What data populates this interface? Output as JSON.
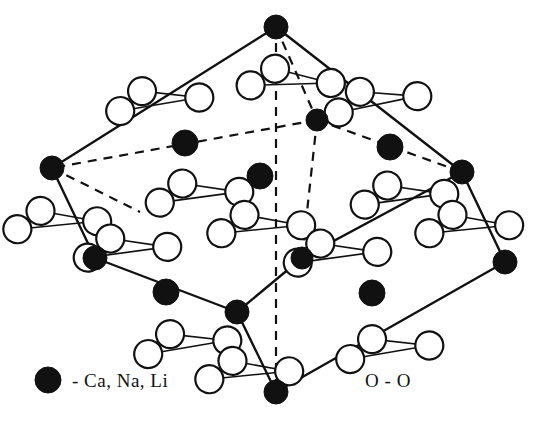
{
  "figure": {
    "colors": {
      "atom_fill": "#111111",
      "atom_open_fill": "#ffffff",
      "stroke": "#111111",
      "background": "#ffffff"
    }
  },
  "legend": {
    "cation_symbol": "filled-circle",
    "cation_label": "- Ca, Na, Li",
    "oxygen_label": "O - O",
    "oxygen_symbol": "open-circle"
  },
  "structure": {
    "cell_vertices": [
      {
        "id": "top",
        "x": 276,
        "y": 27,
        "r": 12,
        "type": "cation"
      },
      {
        "id": "left",
        "x": 52,
        "y": 168,
        "r": 12,
        "type": "cation"
      },
      {
        "id": "right",
        "x": 462,
        "y": 172,
        "r": 12,
        "type": "cation"
      },
      {
        "id": "back",
        "x": 317,
        "y": 120,
        "r": 11,
        "type": "cation"
      },
      {
        "id": "lower-left",
        "x": 95,
        "y": 258,
        "r": 12,
        "type": "cation"
      },
      {
        "id": "lower-right",
        "x": 505,
        "y": 262,
        "r": 12,
        "type": "cation"
      },
      {
        "id": "front-mid",
        "x": 237,
        "y": 312,
        "r": 12,
        "type": "cation"
      },
      {
        "id": "bottom",
        "x": 276,
        "y": 392,
        "r": 12,
        "type": "cation"
      },
      {
        "id": "inner-right",
        "x": 302,
        "y": 258,
        "r": 11,
        "type": "cation"
      }
    ],
    "interior_cations": [
      {
        "id": "int-1",
        "x": 185,
        "y": 143,
        "r": 13
      },
      {
        "id": "int-2",
        "x": 260,
        "y": 176,
        "r": 13
      },
      {
        "id": "int-3",
        "x": 390,
        "y": 147,
        "r": 13
      },
      {
        "id": "int-4",
        "x": 166,
        "y": 292,
        "r": 13
      },
      {
        "id": "int-5",
        "x": 372,
        "y": 293,
        "r": 13
      }
    ],
    "solid_edges": [
      {
        "from": "top",
        "to": "left"
      },
      {
        "from": "top",
        "to": "right"
      },
      {
        "from": "left",
        "to": "lower-left"
      },
      {
        "from": "right",
        "to": "lower-right"
      },
      {
        "from": "lower-left",
        "to": "front-mid"
      },
      {
        "from": "front-mid",
        "to": "bottom"
      },
      {
        "from": "bottom",
        "to": "lower-right"
      },
      {
        "from": "front-mid",
        "to": "inner-right"
      },
      {
        "from": "inner-right",
        "to": "right"
      }
    ],
    "dashed_edges": [
      {
        "from": "top",
        "to": "back"
      },
      {
        "from": "back",
        "to": "left"
      },
      {
        "from": "back",
        "to": "right"
      },
      {
        "from": "top",
        "to": "bottom",
        "note": "vertical axis"
      },
      {
        "from": "back",
        "to": "inner-right"
      },
      {
        "from": "left",
        "to": "inner-left-hidden"
      }
    ],
    "oxygen_clusters": [
      {
        "id": "ox-top-left",
        "cx": 160,
        "cy": 97,
        "angle": -14
      },
      {
        "id": "ox-top-inner",
        "cx": 292,
        "cy": 77,
        "angle": -6
      },
      {
        "id": "ox-top-right",
        "cx": 378,
        "cy": 97,
        "angle": -16
      },
      {
        "id": "ox-left-edge",
        "cx": 58,
        "cy": 218,
        "angle": -10
      },
      {
        "id": "ox-left-low",
        "cx": 128,
        "cy": 245,
        "angle": -12
      },
      {
        "id": "ox-mid-left",
        "cx": 200,
        "cy": 190,
        "angle": -12
      },
      {
        "id": "ox-center",
        "cx": 262,
        "cy": 222,
        "angle": -10
      },
      {
        "id": "ox-mid-right",
        "cx": 405,
        "cy": 192,
        "angle": -12
      },
      {
        "id": "ox-right-edge",
        "cx": 470,
        "cy": 222,
        "angle": -10
      },
      {
        "id": "ox-inner-low",
        "cx": 338,
        "cy": 250,
        "angle": -12
      },
      {
        "id": "ox-bot-left",
        "cx": 188,
        "cy": 340,
        "angle": -14
      },
      {
        "id": "ox-bot-mid",
        "cx": 250,
        "cy": 368,
        "angle": -10
      },
      {
        "id": "ox-bot-right",
        "cx": 390,
        "cy": 345,
        "angle": -14
      }
    ],
    "oxygen_radius": 14,
    "cluster_offsets": {
      "left_a": {
        "dx": -42,
        "dy": 4
      },
      "left_b": {
        "dx": -16,
        "dy": -10
      },
      "right": {
        "dx": 38,
        "dy": 10
      }
    }
  }
}
